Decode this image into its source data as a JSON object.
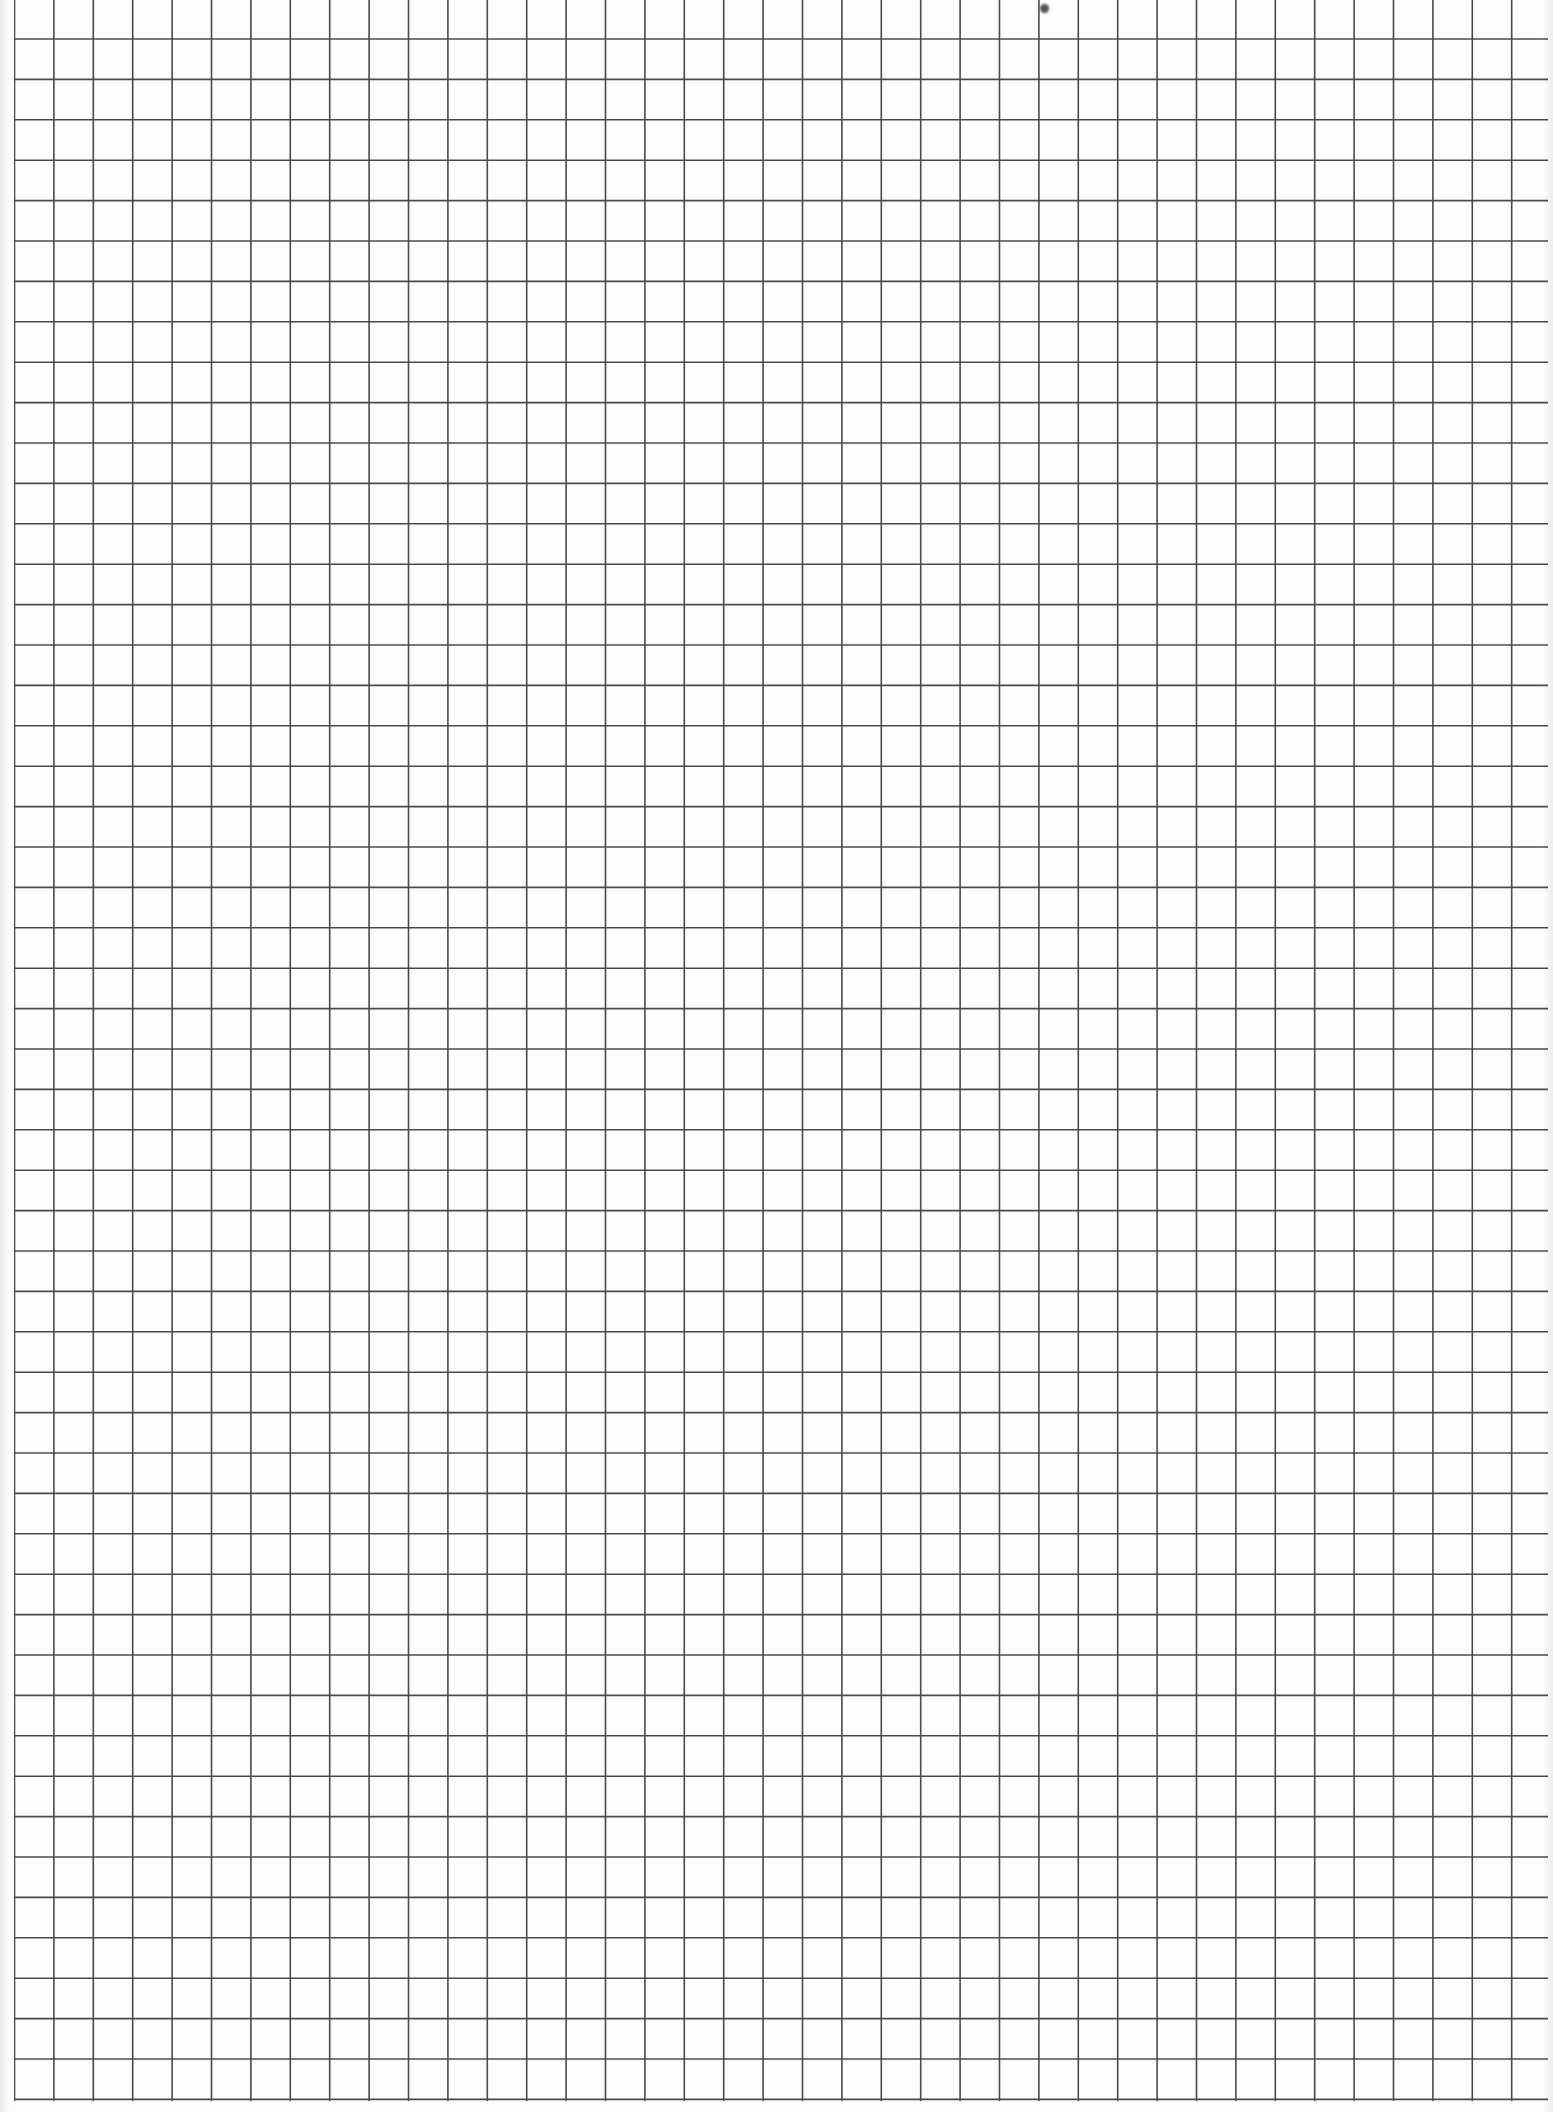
{
  "sheet": {
    "type": "graph-paper",
    "background_color": "#fdfdfd",
    "line_color": "#4a4a4a",
    "line_width": 1.6,
    "grid": {
      "origin_x": 14,
      "vertical_line_count": 39,
      "vertical_spacing_px": 39.4,
      "vertical_line_top": 0,
      "vertical_line_bottom": 2101,
      "horizontal_line_first_y": 39,
      "horizontal_line_count": 52,
      "horizontal_spacing_px": 40.4,
      "horizontal_line_right_extent": 1548
    },
    "marks": [
      {
        "type": "smudge",
        "x": 1044,
        "y": 8
      }
    ]
  }
}
